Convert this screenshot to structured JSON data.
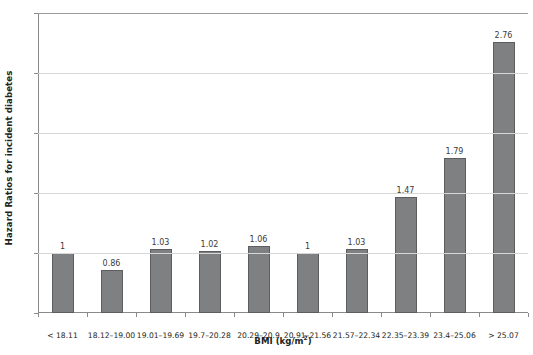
{
  "chart_data": {
    "type": "bar",
    "title": "",
    "xlabel": "BMI (kg/m2)",
    "xlabel_base": "BMI (kg/m",
    "xlabel_sup": "2",
    "xlabel_tail": ")",
    "ylabel": "Hazard Ratios for incident diabetes",
    "categories": [
      "< 18.11",
      "18.12–19.00",
      "19.01–19.69",
      "19.7–20.28",
      "20.29–20.9",
      "20.91–21.56",
      "21.57–22.34",
      "22.35–23.39",
      "23.4–25.06",
      "> 25.07"
    ],
    "values": [
      1,
      0.86,
      1.03,
      1.02,
      1.06,
      1,
      1.03,
      1.47,
      1.79,
      2.76
    ],
    "value_labels": [
      "1",
      "0.86",
      "1.03",
      "1.02",
      "1.06",
      "1",
      "1.03",
      "1.47",
      "1.79",
      "2.76"
    ],
    "ylim": [
      0.5,
      3
    ],
    "yticks": [
      0.5,
      1,
      1.5,
      2,
      2.5,
      3
    ],
    "ytick_labels": [
      "0.5",
      "1",
      "1.5",
      "2",
      "2.5",
      "3"
    ],
    "gridlines": [
      1,
      1.5,
      2,
      2.5,
      3
    ],
    "grid": true,
    "legend": "none",
    "bar_color": "#7f8081",
    "bar_edge_color": "#5c5d5e",
    "grid_color": "#d7d7d7",
    "axis_color": "#8a8a8a",
    "text_color": "#231f20"
  }
}
